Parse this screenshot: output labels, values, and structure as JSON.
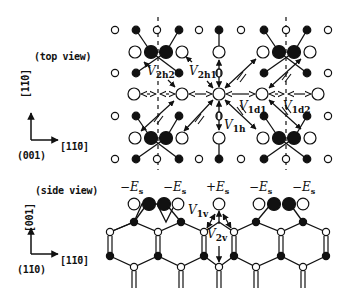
{
  "figure": {
    "top_view": {
      "label": "(top view)",
      "axes": {
        "vertical": "[1̄1̄0]",
        "horizontal": "[1̄1̄0]",
        "origin": "(001)"
      },
      "interaction_labels": {
        "V2h2": {
          "main": "V",
          "sub": "2h2"
        },
        "V2h1": {
          "main": "V",
          "sub": "2h1"
        },
        "V1d1": {
          "main": "V",
          "sub": "1d1"
        },
        "V1d2": {
          "main": "V",
          "sub": "1d2"
        },
        "V1h": {
          "main": "V",
          "sub": "1h"
        }
      }
    },
    "side_view": {
      "label": "(side view)",
      "axes": {
        "vertical": "[001]",
        "horizontal": "[1̄1̄0]",
        "origin": "(1̄10)"
      },
      "energy_labels": [
        {
          "sign": "−",
          "E": "E",
          "sub": "s"
        },
        {
          "sign": "−",
          "E": "E",
          "sub": "s"
        },
        {
          "sign": "+",
          "E": "E",
          "sub": "s"
        },
        {
          "sign": "−",
          "E": "E",
          "sub": "s"
        },
        {
          "sign": "−",
          "E": "E",
          "sub": "s"
        }
      ],
      "interaction_labels": {
        "V1v": {
          "main": "V",
          "sub": "1v"
        },
        "V2v": {
          "main": "V",
          "sub": "2v"
        }
      }
    },
    "colors": {
      "ink": "#111111",
      "background": "#ffffff"
    }
  }
}
